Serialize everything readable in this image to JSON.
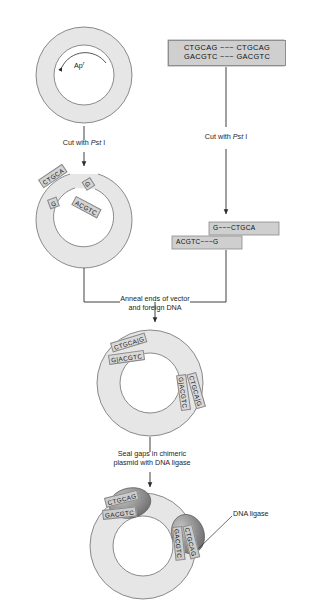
{
  "vector": {
    "marker_label": "Ap",
    "marker_superscript": "r"
  },
  "foreign_dna": {
    "top_strand": "CTGCAG ~~~ CTGCAG",
    "bottom_strand": "GACGTC ~~~ GACGTC"
  },
  "steps": {
    "cut_vector": {
      "pre": "Cut with ",
      "enzyme": "Pst",
      "post": " I"
    },
    "cut_foreign": {
      "pre": "Cut with ",
      "enzyme": "Pst",
      "post": " I"
    },
    "anneal": "Anneal ends of vector\nand foreign DNA",
    "seal": "Seal gaps in chimeric\nplasmid with DNA ligase"
  },
  "cut_vector_ends": {
    "left_top": "CTGCA",
    "left_bottom": "G",
    "right_top": "G",
    "right_bottom": "ACGTC"
  },
  "cut_fragment": {
    "top_strand": "G~~~CTGCA",
    "bottom_strand": "ACGTC~~~G"
  },
  "chimeric_plasmid": {
    "junction_top": {
      "top_strand": "CTGCA|G",
      "bottom_strand": "G|ACGTC"
    },
    "junction_right": {
      "top_strand": "CTGCA|G",
      "bottom_strand": "G|ACGTC"
    }
  },
  "sealed_plasmid": {
    "junction_top": {
      "top_strand": "CTGCAG",
      "bottom_strand": "GACGTC"
    },
    "junction_right": {
      "top_strand": "CTGCAG",
      "bottom_strand": "GACGTC"
    },
    "enzyme_label": "DNA ligase"
  },
  "colors": {
    "plasmid_fill": "#e3e3e3",
    "plasmid_stroke": "#6f6f6f",
    "box_fill": "#cfcfcf",
    "box_stroke": "#8e8e8e",
    "ligase_fill": "#8d8d8d",
    "line": "#2b2b2b"
  }
}
